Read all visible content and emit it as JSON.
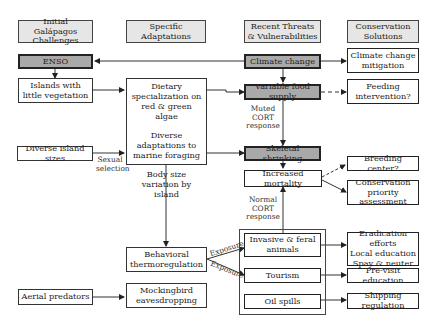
{
  "headers": {
    "col1": "Initial Galápagos Challenges",
    "col2": "Specific Adaptations",
    "col3": "Recent Threats & Vulnerabilities",
    "col4": "Conservation Solutions"
  },
  "nodes": {
    "enso": "ENSO",
    "islands_little_vegetation": "Islands with little vegetation",
    "diverse_island_sizes": "Diverse island sizes",
    "aerial_predators": "Aerial predators",
    "dietary_specialization": "Dietary specialization on red & green algae",
    "diverse_adaptations": "Diverse adaptations to marine foraging",
    "body_size_variation": "Body size variation by island",
    "behavioral_thermoregulation": "Behavioral thermoregulation",
    "mockingbird_eavesdropping": "Mockingbird eavesdropping",
    "climate_change": "Climate change",
    "variable_food_supply": "Variable food supply",
    "skeletal_shrinking": "Skeletal shrinking",
    "increased_mortality": "Increased mortality",
    "invasive_feral": "Invasive & feral animals",
    "tourism": "Tourism",
    "oil_spills": "Oil spills",
    "climate_mitigation": "Climate change mitigation",
    "feeding_intervention": "Feeding intervention?",
    "breeding_center": "Breeding center?",
    "conservation_priority": "Conservation priority assessment",
    "eradication": [
      "Eradication efforts",
      "Local education",
      "Spay & neuter"
    ],
    "previsit_education": "Pre-visit education",
    "shipping_regulation": "Shipping regulation"
  },
  "edge_labels": {
    "sexual_selection": "Sexual selection",
    "muted_cort": "Muted CORT response",
    "normal_cort": "Normal CORT response",
    "exposure_1": "Exposure",
    "exposure_2": "Exposure"
  }
}
